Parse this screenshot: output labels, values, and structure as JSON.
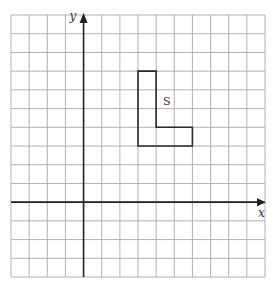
{
  "diagram": {
    "type": "coordinate-grid",
    "grid": {
      "columns": 14,
      "rows": 14,
      "x_range": [
        -4,
        10
      ],
      "y_range": [
        -4,
        10
      ],
      "line_color": "#a8a8a8"
    },
    "axes": {
      "x_label": "x",
      "y_label": "y",
      "color": "#222222"
    },
    "shapes": [
      {
        "name": "S",
        "label": "S",
        "kind": "L-shape",
        "vertices": [
          [
            3,
            7
          ],
          [
            4,
            7
          ],
          [
            4,
            4
          ],
          [
            6,
            4
          ],
          [
            6,
            3
          ],
          [
            3,
            3
          ]
        ],
        "label_position": [
          4.6,
          5.4
        ],
        "stroke": "#2a2a2a"
      }
    ]
  }
}
